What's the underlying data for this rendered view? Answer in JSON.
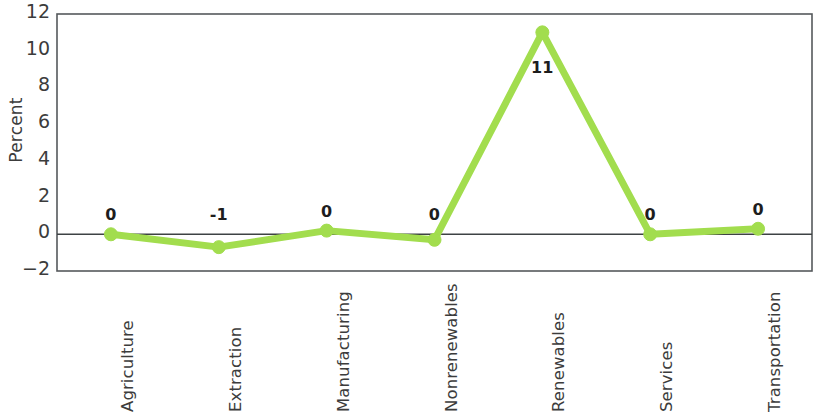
{
  "chart_data": {
    "type": "line",
    "title": "",
    "subtitle": "",
    "xlabel": "",
    "ylabel": "Percent",
    "categories": [
      "Agriculture",
      "Extraction",
      "Manufacturing",
      "Nonrenewables",
      "Renewables",
      "Services",
      "Transportation"
    ],
    "values": [
      0.0,
      -0.7,
      0.2,
      -0.3,
      11.0,
      0.0,
      0.3
    ],
    "point_labels": [
      "0",
      "-1",
      "0",
      "0",
      "11",
      "0",
      "0"
    ],
    "ylim": [
      -2,
      12
    ],
    "yticks": [
      12,
      10,
      8,
      6,
      4,
      2,
      0,
      -2
    ],
    "ytick_labels": [
      "12",
      "10",
      "8",
      "6",
      "4",
      "2",
      "0",
      "−2"
    ],
    "grid": false,
    "legend": "none",
    "series": [
      {
        "name": "Percent",
        "values": [
          0.0,
          -0.7,
          0.2,
          -0.3,
          11.0,
          0.0,
          0.3
        ],
        "color": "#A2DD4E"
      }
    ],
    "zero_line": true,
    "marker": "circle",
    "line_color": "#A2DD4E",
    "marker_color": "#A2DD4E",
    "axis_color": "#55595c",
    "background": "#ffffff"
  }
}
